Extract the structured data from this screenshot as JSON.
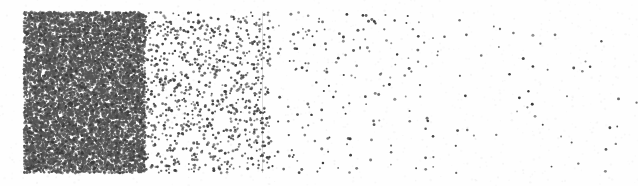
{
  "figure": {
    "type": "stipple-density-plot",
    "width": 638,
    "height": 186,
    "background_color": "#fefefe",
    "paper_tone": "#fdfdfd",
    "caption": "",
    "title": "",
    "axis_labels_visible": false,
    "gridlines_visible": false,
    "border_visible": false
  },
  "chart_data": {
    "type": "scatter",
    "title": "",
    "subtitle": "",
    "xlabel": "",
    "ylabel": "",
    "xlim": [
      24,
      638
    ],
    "ylim": [
      12,
      173
    ],
    "grid": false,
    "legend": null,
    "annotations": [],
    "point_color": "#3a3a3a",
    "point_radius_px": 1.15,
    "regions": [
      {
        "name": "saturated-block",
        "x_start": 24,
        "x_end": 145,
        "y_start": 12,
        "y_end": 173,
        "relative_density": 1.0,
        "point_count": 9000,
        "point_color": "#555555"
      },
      {
        "name": "steep-falloff",
        "x_start": 145,
        "x_end": 270,
        "y_start": 12,
        "y_end": 173,
        "relative_density": 0.085,
        "point_count": 760,
        "point_color": "#3f3f3f"
      },
      {
        "name": "sparse-tail",
        "x_start": 270,
        "x_end": 440,
        "y_start": 12,
        "y_end": 173,
        "relative_density": 0.018,
        "point_count": 150,
        "point_color": "#3a3a3a"
      },
      {
        "name": "very-sparse-tail",
        "x_start": 440,
        "x_end": 638,
        "y_start": 12,
        "y_end": 173,
        "relative_density": 0.004,
        "point_count": 38,
        "point_color": "#3a3a3a"
      }
    ],
    "density_profile": {
      "model": "exponential-decay",
      "x_samples": [
        24,
        60,
        100,
        145,
        150,
        170,
        200,
        240,
        270,
        310,
        360,
        420,
        480,
        540,
        600,
        638
      ],
      "relative_density": [
        1.0,
        1.0,
        1.0,
        1.0,
        0.33,
        0.2,
        0.13,
        0.09,
        0.07,
        0.045,
        0.03,
        0.018,
        0.011,
        0.007,
        0.005,
        0.004
      ]
    }
  },
  "artifacts": {
    "scan_streak": {
      "name": "vertical-scan-streak",
      "x": 262,
      "y": 12,
      "height": 161,
      "color": "rgba(120,120,120,0.22)"
    }
  }
}
